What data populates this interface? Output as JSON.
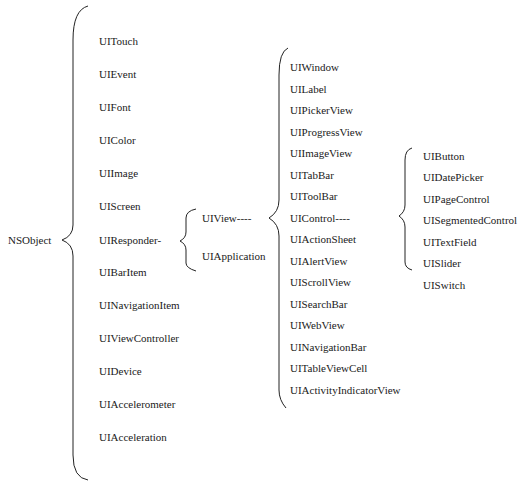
{
  "root": {
    "label": "NSObject"
  },
  "level1": [
    "UITouch",
    "UIEvent",
    "UIFont",
    "UIColor",
    "UIImage",
    "UIScreen",
    "UIResponder-",
    "UIBarItem",
    "UINavigationItem",
    "UIViewController",
    "UIDevice",
    "UIAccelerometer",
    "UIAcceleration"
  ],
  "level2": [
    "UIView----",
    "UIApplication"
  ],
  "level3": [
    "UIWindow",
    "UILabel",
    "UIPickerView",
    "UIProgressView",
    "UIImageView",
    "UITabBar",
    "UIToolBar",
    "UIControl----",
    "UIActionSheet",
    "UIAlertView",
    "UIScrollView",
    "UISearchBar",
    "UIWebView",
    "UINavigationBar",
    "UITableViewCell",
    "UIActivityIndicatorView"
  ],
  "level4": [
    "UIButton",
    "UIDatePicker",
    "UIPageControl",
    "UISegmentedControl",
    "UITextField",
    "UISlider",
    "UISwitch"
  ]
}
